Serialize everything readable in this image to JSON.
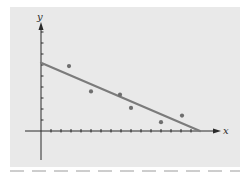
{
  "chart_data": {
    "type": "scatter",
    "title": "",
    "xlabel": "x",
    "ylabel": "y",
    "xlim": [
      -1.5,
      17
    ],
    "ylim": [
      -3,
      8.5
    ],
    "x_tick_count": 15,
    "y_tick_count": 9,
    "x_tick_labels": [],
    "y_tick_labels": [],
    "grid": false,
    "legend": null,
    "series": [
      {
        "name": "data points",
        "kind": "scatter",
        "x": [
          2.8,
          5.0,
          7.9,
          9.0,
          12.0,
          14.1
        ],
        "y": [
          5.9,
          3.6,
          3.3,
          2.1,
          0.8,
          1.4
        ]
      },
      {
        "name": "fitted line",
        "kind": "line",
        "x": [
          0,
          15.9
        ],
        "y": [
          6.2,
          0
        ]
      }
    ]
  },
  "colors": {
    "panel_background": "#e9e9e9",
    "line": "#7b7b7b",
    "points": "#6e6e6e",
    "axes": "#2b2b2b"
  },
  "axes": {
    "x_label": "x",
    "y_label": "y"
  }
}
